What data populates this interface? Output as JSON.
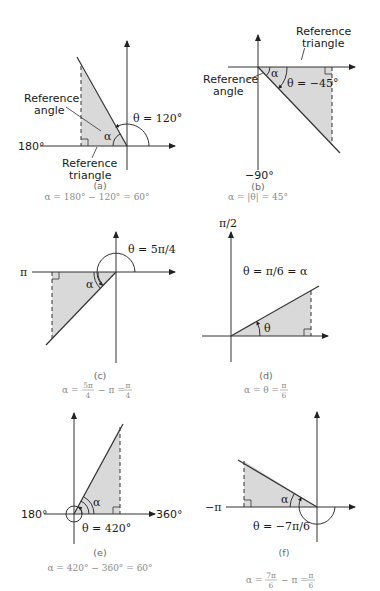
{
  "panels": [
    {
      "id": "(a)",
      "theta_label": "θ = 120°",
      "axis_label_left": "180°",
      "ref_angle_label": "Reference angle",
      "ref_angle_line1": "Reference",
      "ref_angle_line2": "angle",
      "ref_triangle_line1": "Reference",
      "ref_triangle_line2": "triangle",
      "alpha": "α",
      "caption": "α = 180° − 120° = 60°"
    },
    {
      "id": "(b)",
      "theta_label": "θ = −45°",
      "axis_label_bottom": "−90°",
      "ref_angle_line1": "Reference",
      "ref_angle_line2": "angle",
      "ref_triangle_line1": "Reference",
      "ref_triangle_line2": "triangle",
      "alpha": "α",
      "caption": "α = |θ| = 45°"
    },
    {
      "id": "(c)",
      "theta_label": "θ = 5π/4",
      "axis_label_left": "π",
      "alpha": "α",
      "caption_lhs": "α =",
      "caption_num1": "5π",
      "caption_den1": "4",
      "caption_mid": "− π =",
      "caption_num2": "π",
      "caption_den2": "4"
    },
    {
      "id": "(d)",
      "theta_label": "θ = π/6 = α",
      "axis_label_top": "π/2",
      "theta": "θ",
      "caption_lhs": "α = θ =",
      "caption_num": "π",
      "caption_den": "6"
    },
    {
      "id": "(e)",
      "theta_label": "θ = 420°",
      "axis_label_left": "180°",
      "axis_label_right": "360°",
      "alpha": "α",
      "caption": "α = 420° − 360° = 60°"
    },
    {
      "id": "(f)",
      "theta_label": "θ = −7π/6",
      "axis_label_left": "−π",
      "alpha": "α",
      "caption_lhs": "α =",
      "caption_num1": "7π",
      "caption_den1": "6",
      "caption_mid": "− π =",
      "caption_num2": "π",
      "caption_den2": "6"
    }
  ],
  "colors": {
    "fill": "#d9d9d9",
    "line": "#333333",
    "caption": "#8a8a8a"
  }
}
